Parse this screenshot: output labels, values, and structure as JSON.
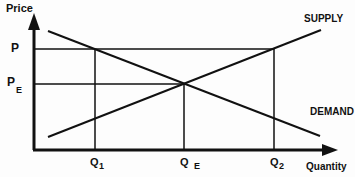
{
  "diagram": {
    "axes": {
      "y_label": "Price",
      "x_label": "Quantity"
    },
    "curves": {
      "supply_label": "SUPPLY",
      "demand_label": "DEMAND"
    },
    "price_levels": {
      "p_label": "P",
      "pe_label_main": "P",
      "pe_label_sub": "E"
    },
    "quantity_levels": {
      "q1_main": "Q",
      "q1_sub": "1",
      "qe_main": "Q",
      "qe_sub": "E",
      "q2_main": "Q",
      "q2_sub": "2"
    },
    "colors": {
      "ink": "#111111",
      "background": "#fdfdfd"
    }
  }
}
